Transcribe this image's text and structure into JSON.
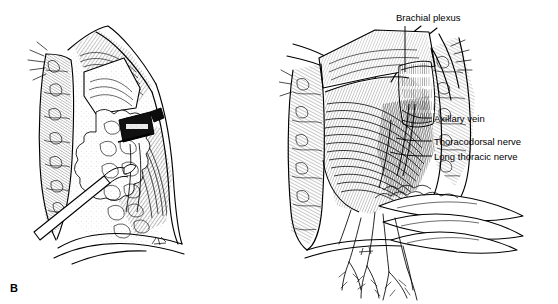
{
  "figure": {
    "kind": "anatomical-line-illustration",
    "background_color": "#ffffff",
    "ink_color": "#000000"
  },
  "panels": [
    {
      "id": "B",
      "letter": "B",
      "description": "Opened axillary wound with retracted skin flaps, axillary fat pad, surgical clamp and probe"
    },
    {
      "id": "C",
      "letter": "C",
      "description": "Deeper axillary dissection exposing chest wall musculature, axillary vein and nerves"
    }
  ],
  "labels": [
    {
      "id": "brachial-plexus",
      "text": "Brachial plexus",
      "panel": "C",
      "leader": "vertical-down"
    },
    {
      "id": "axillary-vein",
      "text": "Axillary vein",
      "panel": "C",
      "leader": "horizontal-left"
    },
    {
      "id": "thoracodorsal-nerve",
      "text": "Thoracodorsal nerve",
      "panel": "C",
      "leader": "horizontal-left"
    },
    {
      "id": "long-thoracic-nerve",
      "text": "Long thoracic nerve",
      "panel": "C",
      "leader": "horizontal-left"
    }
  ]
}
